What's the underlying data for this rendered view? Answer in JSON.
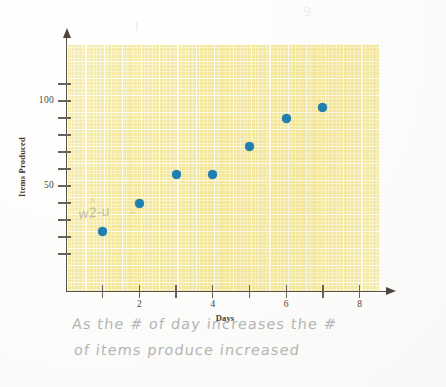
{
  "document": {
    "type": "handwritten-worksheet-scan",
    "background_color": "#fdfdfc"
  },
  "chart_data": {
    "type": "scatter",
    "title": "",
    "xlabel": "Days",
    "ylabel": "Items Produced",
    "x": [
      1,
      2,
      3,
      4,
      5,
      6,
      7
    ],
    "values": [
      23,
      40,
      57,
      57,
      73,
      90,
      96
    ],
    "points": [
      {
        "x": 1,
        "y": 23
      },
      {
        "x": 2,
        "y": 40
      },
      {
        "x": 3,
        "y": 57
      },
      {
        "x": 4,
        "y": 57
      },
      {
        "x": 5,
        "y": 73
      },
      {
        "x": 6,
        "y": 90
      },
      {
        "x": 7,
        "y": 96
      }
    ],
    "xlim": [
      0,
      8.9
    ],
    "ylim": [
      0,
      125
    ],
    "x_ticks": [
      1,
      2,
      3,
      4,
      5,
      6,
      7,
      8
    ],
    "x_tick_labels": [
      "",
      "2",
      "",
      "4",
      "",
      "6",
      "",
      "8"
    ],
    "y_ticks": [
      10,
      20,
      30,
      40,
      50,
      60,
      70,
      80,
      90,
      100,
      110
    ],
    "y_tick_labels": [
      "",
      "",
      "",
      "",
      "50",
      "",
      "",
      "",
      "",
      "100",
      ""
    ],
    "grid": true,
    "grid_style": "graph-paper",
    "legend": "none",
    "marker_color": "#1f7fb5",
    "plot_background_color": "#f4e89a",
    "axis_color": "#595048"
  },
  "axes": {
    "y_title": "Items Produced",
    "x_title": "Days",
    "y_labels": [
      {
        "value": 100,
        "text": "100"
      },
      {
        "value": 50,
        "text": "50"
      }
    ],
    "x_labels": [
      {
        "value": 2,
        "text": "2"
      },
      {
        "value": 4,
        "text": "4"
      },
      {
        "value": 6,
        "text": "6"
      },
      {
        "value": 8,
        "text": "8"
      }
    ]
  },
  "annotations": {
    "answer_line_1": "As the # of day increases the #",
    "answer_line_2": "of items produce increased",
    "scribble_near_first_point": "w2-u",
    "caret_mark": "^",
    "tick_mark": "⌐",
    "top_smudge": "9"
  }
}
